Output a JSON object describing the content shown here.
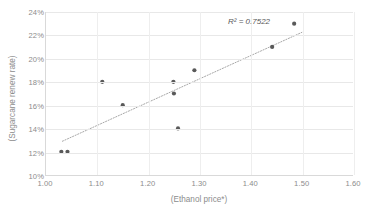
{
  "chart_data": {
    "type": "scatter",
    "title": "",
    "xlabel": "(Ethanol price*)",
    "ylabel": "(Sugarcane renew rate)",
    "xlim": [
      1.0,
      1.6
    ],
    "ylim": [
      0.1,
      0.24
    ],
    "xticks": [
      "1.00",
      "1.10",
      "1.20",
      "1.30",
      "1.40",
      "1.50",
      "1.60"
    ],
    "xtick_values": [
      1.0,
      1.1,
      1.2,
      1.3,
      1.4,
      1.5,
      1.6
    ],
    "yticks": [
      "10%",
      "12%",
      "14%",
      "16%",
      "18%",
      "20%",
      "22%",
      "24%"
    ],
    "ytick_values": [
      0.1,
      0.12,
      0.14,
      0.16,
      0.18,
      0.2,
      0.22,
      0.24
    ],
    "grid": true,
    "legend": "none",
    "annotations": [
      {
        "text": "R² = 0.7522",
        "x": 1.44,
        "y": 0.2335
      }
    ],
    "series": [
      {
        "name": "observations",
        "marker": "circle",
        "color": "#595959",
        "points": [
          {
            "x": 1.03,
            "y": 0.12
          },
          {
            "x": 1.042,
            "y": 0.12
          },
          {
            "x": 1.11,
            "y": 0.18
          },
          {
            "x": 1.15,
            "y": 0.16
          },
          {
            "x": 1.249,
            "y": 0.18
          },
          {
            "x": 1.25,
            "y": 0.17
          },
          {
            "x": 1.258,
            "y": 0.14
          },
          {
            "x": 1.29,
            "y": 0.19
          },
          {
            "x": 1.442,
            "y": 0.21
          },
          {
            "x": 1.485,
            "y": 0.23
          }
        ]
      }
    ],
    "trendline": {
      "type": "linear",
      "style": "dotted",
      "color": "#a6a6a6",
      "r_squared": 0.7522,
      "x_start": 1.032,
      "y_start": 0.129,
      "x_end": 1.5,
      "y_end": 0.2225
    }
  }
}
